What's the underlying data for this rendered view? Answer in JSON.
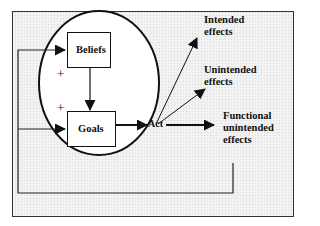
{
  "diagram": {
    "nodes": {
      "beliefs": "Beliefs",
      "goals": "Goals",
      "act": "Act"
    },
    "signs": {
      "beliefs_plus": "+",
      "goals_plus": "+"
    },
    "effects": {
      "intended_line1": "Intended",
      "intended_line2": "effects",
      "unintended_line1": "Unintended",
      "unintended_line2": "effects",
      "functional_line1": "Functional",
      "functional_line2": "unintended",
      "functional_line3": "effects"
    },
    "colors": {
      "background": "#eeeeee",
      "stroke": "#111111",
      "box_fill": "#ffffff"
    }
  }
}
